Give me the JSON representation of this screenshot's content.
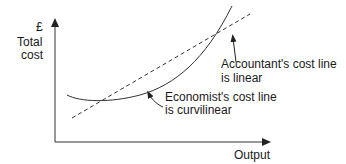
{
  "diagram": {
    "y_axis": {
      "currency": "£",
      "label_line1": "Total",
      "label_line2": "cost"
    },
    "x_axis": {
      "label": "Output"
    },
    "annotations": {
      "accountant": {
        "line1": "Accountant's cost line",
        "line2": "is linear"
      },
      "economist": {
        "line1": "Economist's cost line",
        "line2": "is curvilinear"
      }
    },
    "colors": {
      "line": "#333333"
    }
  }
}
